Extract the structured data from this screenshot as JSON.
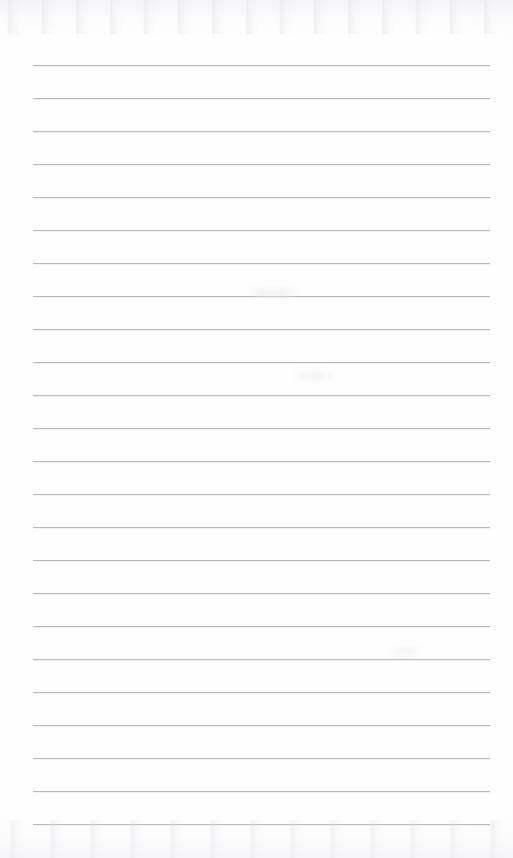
{
  "document": {
    "kind": "scanned-lined-paper",
    "title": "Blank ruled notebook page",
    "page_width": 513,
    "page_height": 858,
    "background_color": "#fefefe",
    "has_text_content": false,
    "has_margin_rule": false,
    "has_punch_holes": false,
    "written_content": ""
  },
  "ruling": {
    "line_color": "#b9b9b9",
    "line_thickness": 1,
    "line_count": 24,
    "line_spacing": 33,
    "left_margin": 33,
    "right_edge": 490,
    "line_length": 457,
    "first_line_y": 65,
    "last_line_y": 824,
    "lines": [
      {
        "index": 1,
        "y": 65,
        "x": 33,
        "width": 457
      },
      {
        "index": 2,
        "y": 98,
        "x": 33,
        "width": 457
      },
      {
        "index": 3,
        "y": 131,
        "x": 33,
        "width": 457
      },
      {
        "index": 4,
        "y": 164,
        "x": 33,
        "width": 457
      },
      {
        "index": 5,
        "y": 197,
        "x": 33,
        "width": 457
      },
      {
        "index": 6,
        "y": 230,
        "x": 33,
        "width": 457
      },
      {
        "index": 7,
        "y": 263,
        "x": 33,
        "width": 457
      },
      {
        "index": 8,
        "y": 296,
        "x": 33,
        "width": 457
      },
      {
        "index": 9,
        "y": 329,
        "x": 33,
        "width": 457
      },
      {
        "index": 10,
        "y": 362,
        "x": 33,
        "width": 457
      },
      {
        "index": 11,
        "y": 395,
        "x": 33,
        "width": 457
      },
      {
        "index": 12,
        "y": 428,
        "x": 33,
        "width": 457
      },
      {
        "index": 13,
        "y": 461,
        "x": 33,
        "width": 457
      },
      {
        "index": 14,
        "y": 494,
        "x": 33,
        "width": 457
      },
      {
        "index": 15,
        "y": 527,
        "x": 33,
        "width": 457
      },
      {
        "index": 16,
        "y": 560,
        "x": 33,
        "width": 457
      },
      {
        "index": 17,
        "y": 593,
        "x": 33,
        "width": 457
      },
      {
        "index": 18,
        "y": 626,
        "x": 33,
        "width": 457
      },
      {
        "index": 19,
        "y": 659,
        "x": 33,
        "width": 457
      },
      {
        "index": 20,
        "y": 692,
        "x": 33,
        "width": 457
      },
      {
        "index": 21,
        "y": 725,
        "x": 33,
        "width": 457
      },
      {
        "index": 22,
        "y": 758,
        "x": 33,
        "width": 457
      },
      {
        "index": 23,
        "y": 791,
        "x": 33,
        "width": 457
      },
      {
        "index": 24,
        "y": 824,
        "x": 33,
        "width": 457
      }
    ]
  },
  "artifacts": {
    "top_noise_band_height": 34,
    "bottom_noise_band_height": 38,
    "smudges": [
      {
        "x": 250,
        "y": 288,
        "w": 46,
        "h": 9
      },
      {
        "x": 392,
        "y": 648,
        "w": 28,
        "h": 7
      },
      {
        "x": 296,
        "y": 372,
        "w": 34,
        "h": 8
      }
    ]
  }
}
